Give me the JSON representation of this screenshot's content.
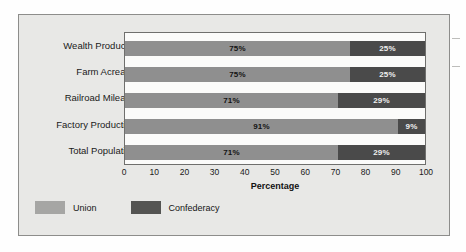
{
  "chart_data": {
    "type": "bar",
    "orientation": "horizontal",
    "stacked": true,
    "stacked_total": 100,
    "title": "",
    "xlabel": "Percentage",
    "ylabel": "",
    "xlim": [
      0,
      100
    ],
    "xticks": [
      0,
      10,
      20,
      30,
      40,
      50,
      60,
      70,
      80,
      90,
      100
    ],
    "xtick_labels": [
      "0",
      "10",
      "20",
      "30",
      "40",
      "50",
      "60",
      "70",
      "80",
      "90",
      "100"
    ],
    "grid": false,
    "legend_position": "bottom-left",
    "categories": [
      "Wealth Produced",
      "Farm Acreage",
      "Railroad Mileage",
      "Factory Production",
      "Total Population"
    ],
    "series": [
      {
        "name": "Union",
        "color": "#8f8f8f",
        "values": [
          75,
          75,
          71,
          91,
          71
        ],
        "value_labels": [
          "75%",
          "75%",
          "71%",
          "91%",
          "71%"
        ]
      },
      {
        "name": "Confederacy",
        "color": "#4a4a4a",
        "values": [
          25,
          25,
          29,
          9,
          29
        ],
        "value_labels": [
          "25%",
          "25%",
          "29%",
          "9%",
          "29%"
        ]
      }
    ]
  },
  "legend": {
    "items": [
      {
        "label": "Union",
        "color": "#a6a6a4"
      },
      {
        "label": "Confederacy",
        "color": "#545452"
      }
    ]
  },
  "colors": {
    "page_background": "#fefefe",
    "card_background": "#e8e8e6",
    "card_border": "#8d8d8b",
    "plot_background": "#fbfbfa",
    "plot_border": "#6f6f6d",
    "union": "#8f8f8f",
    "confederacy": "#4a4a4a",
    "text": "#1a1a1a"
  }
}
